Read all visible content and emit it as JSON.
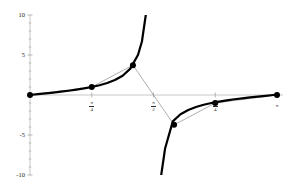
{
  "chart_data": {
    "type": "line",
    "title": "",
    "subtitle": "",
    "xlabel": "",
    "ylabel": "",
    "xlim": [
      0,
      3.14159265
    ],
    "ylim": [
      -10,
      10
    ],
    "grid": false,
    "legend": null,
    "axes": {
      "y_axis_x_value": 0,
      "x_axis_y_value": 0,
      "y_ticks_major": [
        -10,
        -5,
        5,
        10
      ],
      "y_tick_labels": [
        "-10",
        "-5",
        "5",
        "10"
      ],
      "y_ticks_minor": [
        -9,
        -8,
        -7,
        -6,
        -4,
        -3,
        -2,
        -1,
        1,
        2,
        3,
        4,
        6,
        7,
        8,
        9
      ],
      "x_ticks": [
        0.78539816,
        1.57079633,
        2.35619449,
        3.14159265
      ],
      "x_tick_labels": [
        {
          "numerator": "π",
          "denominator": "4",
          "is_fraction": true
        },
        {
          "numerator": "π",
          "denominator": "2",
          "is_fraction": true
        },
        {
          "numerator": "3π",
          "denominator": "4",
          "is_fraction": true
        },
        {
          "numerator": "π",
          "denominator": "",
          "is_fraction": false
        }
      ]
    },
    "series": [
      {
        "name": "tan(x)",
        "role": "function-curve",
        "style": "thick-solid",
        "color": "#000000",
        "width": 2.2,
        "asymptotes": [
          1.57079633
        ],
        "x": [
          0,
          0.0982,
          0.1963,
          0.2945,
          0.3927,
          0.4909,
          0.589,
          0.6872,
          0.7854,
          0.8836,
          0.9817,
          1.0799,
          1.1781,
          1.2763,
          1.3744,
          1.4235,
          1.4726,
          1.4972,
          1.5217,
          1.534,
          1.5463,
          1.5953,
          1.6076,
          1.6199,
          1.6444,
          1.669,
          1.7181,
          1.8163,
          1.9144,
          2.0126,
          2.1108,
          2.209,
          2.3071,
          2.4053,
          2.5035,
          2.6017,
          2.6998,
          2.798,
          2.8962,
          2.9943,
          3.0925,
          3.14159
        ],
        "y": [
          0,
          0.0985,
          0.1989,
          0.3033,
          0.4142,
          0.5345,
          0.6682,
          0.8206,
          1.0,
          1.2185,
          1.4966,
          1.8708,
          2.4142,
          3.2965,
          5.0273,
          6.6912,
          10.0,
          16.4,
          35.0,
          70.0,
          200.0,
          -200.0,
          -70.0,
          -35.0,
          -16.4,
          -10.0,
          -6.6912,
          -3.2965,
          -2.4142,
          -1.8708,
          -1.4966,
          -1.2185,
          -1.0,
          -0.8206,
          -0.6682,
          -0.5345,
          -0.4142,
          -0.3033,
          -0.1989,
          -0.0985,
          0.0,
          0.0
        ]
      },
      {
        "name": "secant-polyline",
        "role": "interpolating-polyline",
        "style": "thin-solid",
        "color": "#8c8c8c",
        "width": 0.7,
        "x": [
          0,
          0.78539816,
          1.30899694,
          1.83259571,
          2.35619449,
          3.14159265
        ],
        "y": [
          0,
          1.0,
          3.7321,
          -3.7321,
          -1.0,
          0
        ]
      }
    ],
    "markers": {
      "shape": "filled-circle",
      "color": "#000000",
      "radius": 3.0,
      "points": [
        {
          "x": 0,
          "y": 0,
          "label": "0"
        },
        {
          "x": 0.78539816,
          "y": 1.0,
          "label": "π/4"
        },
        {
          "x": 1.30899694,
          "y": 3.7321,
          "label": "5π/12"
        },
        {
          "x": 1.83259571,
          "y": -3.7321,
          "label": "7π/12"
        },
        {
          "x": 2.35619449,
          "y": -1.0,
          "label": "3π/4"
        },
        {
          "x": 3.14159265,
          "y": 0,
          "label": "π"
        }
      ]
    },
    "colors": {
      "curve": "#000000",
      "polyline": "#8c8c8c",
      "axis": "#b0b0b0",
      "tick": "#9a9a9a",
      "text": "#1a1a1a",
      "background": "#ffffff"
    }
  }
}
